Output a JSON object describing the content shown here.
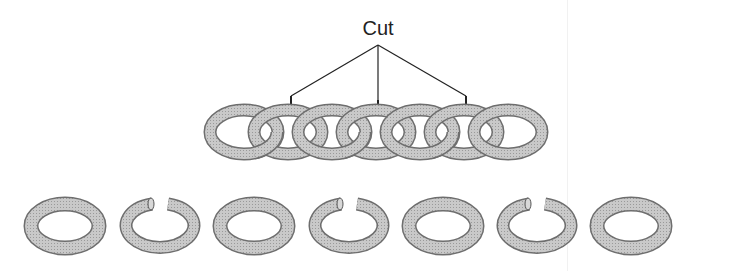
{
  "diagram": {
    "title": "",
    "cut_label": "Cut",
    "chain": {
      "ring_count": 7,
      "cut_positions": [
        2,
        4,
        6
      ],
      "description": "Seven interlocked links forming a chain"
    },
    "separated_rings": [
      {
        "index": 1,
        "state": "closed"
      },
      {
        "index": 2,
        "state": "open"
      },
      {
        "index": 3,
        "state": "closed"
      },
      {
        "index": 4,
        "state": "open"
      },
      {
        "index": 5,
        "state": "closed"
      },
      {
        "index": 6,
        "state": "open"
      },
      {
        "index": 7,
        "state": "closed"
      }
    ],
    "colors": {
      "ring_fill": "#c4c4c4",
      "ring_edge": "#6e6e6e",
      "line": "#222222"
    }
  }
}
